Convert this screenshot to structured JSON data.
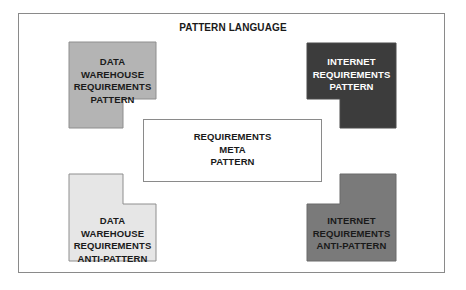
{
  "diagram": {
    "title": "PATTERN LANGUAGE",
    "colors": {
      "frame_border": "#8a8a8a",
      "dw_pattern_fill": "#b4b4b4",
      "internet_pattern_fill": "#3c3c3c",
      "dw_antipattern_fill": "#e6e6e6",
      "internet_antipattern_fill": "#7a7a7a"
    },
    "nodes": {
      "dw_pattern": {
        "lines": [
          "DATA WAREHOUSE",
          "REQUIREMENTS",
          "PATTERN"
        ]
      },
      "internet_pattern": {
        "lines": [
          "INTERNET",
          "REQUIREMENTS",
          "PATTERN"
        ]
      },
      "meta_pattern": {
        "lines": [
          "REQUIREMENTS",
          "META",
          "PATTERN"
        ]
      },
      "dw_antipattern": {
        "lines": [
          "DATA WAREHOUSE",
          "REQUIREMENTS",
          "ANTI-PATTERN"
        ]
      },
      "internet_antipattern": {
        "lines": [
          "INTERNET",
          "REQUIREMENTS",
          "ANTI-PATTERN"
        ]
      }
    }
  }
}
